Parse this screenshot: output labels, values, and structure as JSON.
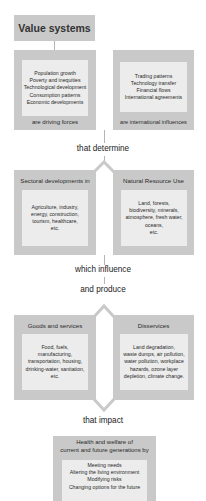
{
  "top": {
    "title": "Value systems"
  },
  "row1": {
    "left": {
      "items": [
        "Population growth",
        "Poverty and inequities",
        "Technological development",
        "Consumption patterns",
        "Economic developments"
      ],
      "caption": "are driving forces"
    },
    "right": {
      "items": [
        "Trading patterns",
        "Technology transfer",
        "Financial flows",
        "International agreements"
      ],
      "caption": "are international influences"
    },
    "connector": "that determine"
  },
  "row2": {
    "left": {
      "title": "Sectoral developments in",
      "items": [
        "Agriculture, industry,",
        "energy, construction,",
        "tourism, healthcare,",
        "etc."
      ]
    },
    "right": {
      "title": "Natural Resource Use",
      "items": [
        "Land, forests,",
        "biodiversity, minerals,",
        "atmosphere, fresh water,",
        "oceans,",
        "etc."
      ]
    },
    "connector_1": "which influence",
    "connector_2": "and produce"
  },
  "row3": {
    "left": {
      "title": "Goods and services",
      "items": [
        "Food, fuels,",
        "manufacturing,",
        "transportation, housing,",
        "drinking-water, sanitation,",
        "etc."
      ]
    },
    "right": {
      "title": "Disservices",
      "items": [
        "Land degradation,",
        "waste dumps, air pollution,",
        "water pollution, workplace",
        "hazards, ozone layer",
        "depletion, climate change."
      ]
    },
    "connector": "that impact"
  },
  "bottom": {
    "title_1": "Health and welfare of",
    "title_2": "current and future generations by",
    "items": [
      "Meeting needs",
      "Altering the living environment",
      "Modifying risks",
      "Changing options for the future"
    ]
  },
  "colors": {
    "outer_box": "#c9c9c9",
    "inner_box": "#ececec",
    "connector_line": "#b5b5b5",
    "text": "#2a2a2a"
  }
}
